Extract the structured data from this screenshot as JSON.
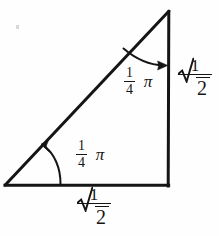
{
  "figure": {
    "name": "right-isosceles-triangle-with-angle-and-side-labels",
    "background_color": "#fefefe",
    "ink_color": "#151515",
    "width": 219,
    "height": 236
  },
  "diagram_data": {
    "type": "geometry-diagram",
    "shape": "right triangle",
    "vertices": {
      "bottom_left": [
        5,
        185
      ],
      "bottom_right": [
        168,
        185
      ],
      "apex": [
        169,
        11
      ]
    },
    "edges": [
      {
        "name": "base",
        "from": "bottom_left",
        "to": "bottom_right"
      },
      {
        "name": "vertical-leg",
        "from": "bottom_right",
        "to": "apex"
      },
      {
        "name": "hypotenuse",
        "from": "bottom_left",
        "to": "apex"
      }
    ],
    "right_angle_at": "bottom_right",
    "angle_arcs": [
      {
        "name": "top-angle-arc",
        "at_vertex": "apex",
        "from_edge": "hypotenuse",
        "to_edge": "vertical-leg",
        "arrow_at": "vertical-leg"
      },
      {
        "name": "bottom-angle-arc",
        "at_vertex": "bottom_left",
        "from_edge": "base",
        "to_edge": "hypotenuse",
        "arrow_at": "hypotenuse"
      }
    ]
  },
  "labels": {
    "angle_top": {
      "numerator": "1",
      "denominator": "4",
      "symbol": "π"
    },
    "angle_bottom": {
      "numerator": "1",
      "denominator": "4",
      "symbol": "π"
    },
    "side_right": {
      "numerator": "1",
      "radicand": "2"
    },
    "side_bottom": {
      "numerator": "1",
      "radicand": "2"
    }
  }
}
